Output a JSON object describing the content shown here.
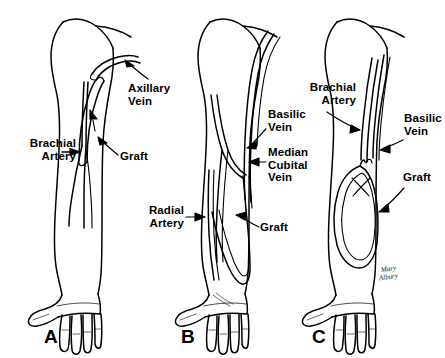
{
  "figure": {
    "background_color": "#ffffff",
    "ink_color": "#000000",
    "width": 445,
    "height": 358
  },
  "panels": [
    {
      "letter": "A",
      "description": "Upper arm straight graft between brachial artery and axillary vein",
      "labels": [
        {
          "id": "a-axillary-vein",
          "text": "Axillary\nVein",
          "align": "left"
        },
        {
          "id": "a-brachial-artery",
          "text": "Brachial\nArtery",
          "align": "right"
        },
        {
          "id": "a-graft",
          "text": "Graft",
          "align": "left"
        }
      ]
    },
    {
      "letter": "B",
      "description": "Forearm loop graft between radial artery and basilic vein",
      "labels": [
        {
          "id": "b-basilic-vein",
          "text": "Basilic\nVein",
          "align": "left"
        },
        {
          "id": "b-median-cubital-vein",
          "text": "Median\nCubital\nVein",
          "align": "left"
        },
        {
          "id": "b-radial-artery",
          "text": "Radial\nArtery",
          "align": "right"
        },
        {
          "id": "b-graft",
          "text": "Graft",
          "align": "left"
        }
      ]
    },
    {
      "letter": "C",
      "description": "Forearm loop graft between brachial artery and basilic vein",
      "labels": [
        {
          "id": "c-brachial-artery",
          "text": "Brachial\nArtery",
          "align": "right"
        },
        {
          "id": "c-basilic-vein",
          "text": "Basilic\nVein",
          "align": "left"
        },
        {
          "id": "c-graft",
          "text": "Graft",
          "align": "left"
        }
      ]
    }
  ],
  "signature": {
    "line1": "Mary",
    "line2": "Albury"
  }
}
